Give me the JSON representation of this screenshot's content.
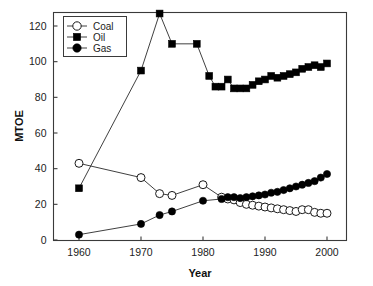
{
  "chart_data": {
    "type": "line",
    "title": "",
    "subtitle": "",
    "xlabel": "Year",
    "ylabel": "MTOE",
    "xlim": [
      1956,
      2003
    ],
    "ylim": [
      0,
      130
    ],
    "xticks": [
      1960,
      1970,
      1980,
      1990,
      2000
    ],
    "yticks": [
      0,
      20,
      40,
      60,
      80,
      100,
      120
    ],
    "grid": false,
    "legend_position": "top-left",
    "legend_entries": [
      "Coal",
      "Oil",
      "Gas"
    ],
    "markers": {
      "Coal": "open-circle",
      "Oil": "filled-square",
      "Gas": "filled-circle"
    },
    "colors": {
      "line": "#2a2a2a",
      "coal_fill": "#ffffff",
      "oil_fill": "#000000",
      "gas_fill": "#000000",
      "axis": "#3a3a3a",
      "background": "#ffffff"
    },
    "series": [
      {
        "name": "Coal",
        "x": [
          1960,
          1970,
          1973,
          1975,
          1980,
          1983,
          1984,
          1985,
          1986,
          1987,
          1988,
          1989,
          1990,
          1991,
          1992,
          1993,
          1994,
          1995,
          1996,
          1997,
          1998,
          1999,
          2000
        ],
        "values": [
          43,
          35,
          26,
          25,
          31,
          24,
          23,
          22.5,
          21,
          20,
          19.5,
          19,
          18.5,
          18,
          17.5,
          17,
          16.5,
          16,
          17,
          17,
          15.5,
          15,
          15
        ]
      },
      {
        "name": "Oil",
        "x": [
          1960,
          1970,
          1973,
          1975,
          1979,
          1981,
          1982,
          1983,
          1984,
          1985,
          1986,
          1987,
          1988,
          1989,
          1990,
          1991,
          1992,
          1993,
          1994,
          1995,
          1996,
          1997,
          1998,
          1999,
          2000
        ],
        "values": [
          29,
          95,
          127,
          110,
          110,
          92,
          86,
          86,
          90,
          85,
          85,
          85,
          87,
          89,
          90,
          92,
          91,
          92,
          93,
          94,
          96,
          97,
          98,
          97,
          99
        ]
      },
      {
        "name": "Gas",
        "x": [
          1960,
          1970,
          1973,
          1975,
          1980,
          1983,
          1984,
          1985,
          1986,
          1987,
          1988,
          1989,
          1990,
          1991,
          1992,
          1993,
          1994,
          1995,
          1996,
          1997,
          1998,
          1999,
          2000
        ],
        "values": [
          3,
          9,
          14,
          16,
          22,
          23,
          24,
          24,
          23.5,
          24,
          24.5,
          25,
          25.5,
          26.5,
          27,
          28,
          29,
          30,
          31,
          32,
          33,
          35,
          37
        ]
      }
    ]
  },
  "axis": {
    "y_title": "MTOE",
    "x_title": "Year",
    "ytick_labels": [
      "0",
      "20",
      "40",
      "60",
      "80",
      "100",
      "120"
    ],
    "xtick_labels": [
      "1960",
      "1970",
      "1980",
      "1990",
      "2000"
    ]
  },
  "legend": {
    "coal_label": "Coal",
    "oil_label": "Oil",
    "gas_label": "Gas"
  }
}
